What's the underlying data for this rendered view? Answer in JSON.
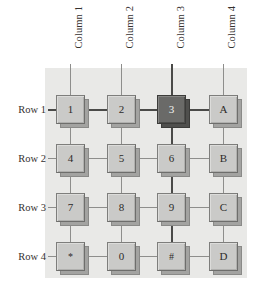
{
  "diagram": {
    "panel": {
      "background_color": "#e9e9e7"
    },
    "wire_colors": {
      "inactive": "#8e8e8c",
      "active": "#4a4a48"
    },
    "key_colors": {
      "cap": "#cacac8",
      "cap_border": "#7e7e7c",
      "shadow": "#a3a3a1",
      "pressed_cap": "#6a6a68",
      "pressed_text": "#f2f2f0",
      "text": "#2d2a28"
    }
  },
  "column_labels": [
    {
      "label": "Column 1",
      "active": false
    },
    {
      "label": "Column 2",
      "active": false
    },
    {
      "label": "Column 3",
      "active": true
    },
    {
      "label": "Column 4",
      "active": false
    }
  ],
  "row_labels": [
    {
      "label": "Row 1",
      "active": true
    },
    {
      "label": "Row 2",
      "active": false
    },
    {
      "label": "Row 3",
      "active": false
    },
    {
      "label": "Row 4",
      "active": false
    }
  ],
  "keys": [
    [
      {
        "label": "1",
        "pressed": false
      },
      {
        "label": "2",
        "pressed": false
      },
      {
        "label": "3",
        "pressed": true
      },
      {
        "label": "A",
        "pressed": false
      }
    ],
    [
      {
        "label": "4",
        "pressed": false
      },
      {
        "label": "5",
        "pressed": false
      },
      {
        "label": "6",
        "pressed": false
      },
      {
        "label": "B",
        "pressed": false
      }
    ],
    [
      {
        "label": "7",
        "pressed": false
      },
      {
        "label": "8",
        "pressed": false
      },
      {
        "label": "9",
        "pressed": false
      },
      {
        "label": "C",
        "pressed": false
      }
    ],
    [
      {
        "label": "*",
        "pressed": false
      },
      {
        "label": "0",
        "pressed": false
      },
      {
        "label": "#",
        "pressed": false
      },
      {
        "label": "D",
        "pressed": false
      }
    ]
  ]
}
